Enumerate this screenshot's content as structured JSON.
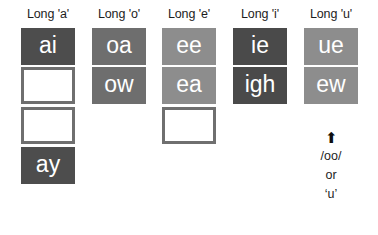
{
  "chart_data": {
    "type": "table",
    "columns": [
      {
        "header": "Long 'a'",
        "left": 14,
        "cells": [
          {
            "text": "ai",
            "filled": true,
            "color": "#4d4d4d"
          },
          {
            "text": "",
            "filled": false,
            "color": "#6f6f6f"
          },
          {
            "text": "",
            "filled": false,
            "color": "#6f6f6f"
          },
          {
            "text": "ay",
            "filled": true,
            "color": "#4d4d4d"
          }
        ]
      },
      {
        "header": "Long 'o'",
        "left": 85,
        "cells": [
          {
            "text": "oa",
            "filled": true,
            "color": "#6e6e6e"
          },
          {
            "text": "ow",
            "filled": true,
            "color": "#6e6e6e"
          }
        ]
      },
      {
        "header": "Long 'e'",
        "left": 155,
        "cells": [
          {
            "text": "ee",
            "filled": true,
            "color": "#8d8d8d"
          },
          {
            "text": "ea",
            "filled": true,
            "color": "#8d8d8d"
          },
          {
            "text": "",
            "filled": false,
            "color": "#6f6f6f"
          }
        ]
      },
      {
        "header": "Long 'i'",
        "left": 226,
        "cells": [
          {
            "text": "ie",
            "filled": true,
            "color": "#4a4a4a"
          },
          {
            "text": "igh",
            "filled": true,
            "color": "#4a4a4a"
          }
        ]
      },
      {
        "header": "Long 'u'",
        "left": 297,
        "cells": [
          {
            "text": "ue",
            "filled": true,
            "color": "#8d8d8d"
          },
          {
            "text": "ew",
            "filled": true,
            "color": "#8d8d8d"
          }
        ]
      }
    ],
    "annotation": {
      "arrow": "⬆",
      "lines": [
        "/oo/",
        "or",
        "‘u’"
      ]
    }
  }
}
